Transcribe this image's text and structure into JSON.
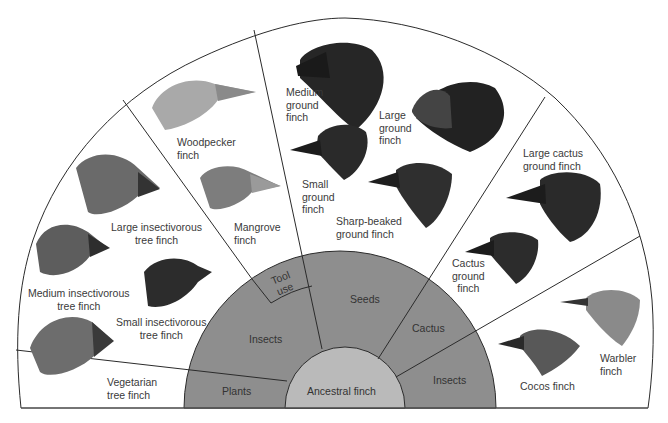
{
  "colors": {
    "outer_fan": "#ffffff",
    "diet_band": "#8e8e8e",
    "ancestral_core": "#bababa",
    "lines": "#2b2b2b"
  },
  "core": {
    "label": "Ancestral finch"
  },
  "diets": [
    {
      "id": "plants",
      "label": "Plants"
    },
    {
      "id": "insects-left",
      "label": "Insects"
    },
    {
      "id": "tool-use",
      "label": "Tool\nuse"
    },
    {
      "id": "seeds",
      "label": "Seeds"
    },
    {
      "id": "cactus",
      "label": "Cactus"
    },
    {
      "id": "insects-right",
      "label": "Insects"
    }
  ],
  "finches": [
    {
      "id": "vegetarian",
      "label": "Vegetarian\ntree finch",
      "diet": "Plants",
      "tone": "#6d6d6d"
    },
    {
      "id": "medium-insectivorous",
      "label": "Medium insectivorous\ntree finch",
      "diet": "Insects",
      "tone": "#5d5d5d"
    },
    {
      "id": "large-insectivorous",
      "label": "Large insectivorous\ntree finch",
      "diet": "Insects",
      "tone": "#6a6a6a"
    },
    {
      "id": "small-insectivorous",
      "label": "Small insectivorous\ntree finch",
      "diet": "Insects",
      "tone": "#2c2c2c"
    },
    {
      "id": "woodpecker",
      "label": "Woodpecker\nfinch",
      "diet": "Tool use",
      "tone": "#a9a9a9"
    },
    {
      "id": "mangrove",
      "label": "Mangrove\nfinch",
      "diet": "Insects",
      "tone": "#7d7d7d"
    },
    {
      "id": "medium-ground",
      "label": "Medium\nground\nfinch",
      "diet": "Seeds",
      "tone": "#262626"
    },
    {
      "id": "large-ground",
      "label": "Large\nground\nfinch",
      "diet": "Seeds",
      "tone": "#222222"
    },
    {
      "id": "small-ground",
      "label": "Small\nground\nfinch",
      "diet": "Seeds",
      "tone": "#2a2a2a"
    },
    {
      "id": "sharp-beaked",
      "label": "Sharp-beaked\nground finch",
      "diet": "Seeds",
      "tone": "#2f2f2f"
    },
    {
      "id": "large-cactus",
      "label": "Large cactus\nground finch",
      "diet": "Cactus",
      "tone": "#2a2a2a"
    },
    {
      "id": "cactus-ground",
      "label": "Cactus\nground\nfinch",
      "diet": "Cactus",
      "tone": "#2c2c2c"
    },
    {
      "id": "warbler",
      "label": "Warbler\nfinch",
      "diet": "Insects",
      "tone": "#8a8a8a"
    },
    {
      "id": "cocos",
      "label": "Cocos finch",
      "diet": "Insects",
      "tone": "#585858"
    }
  ]
}
